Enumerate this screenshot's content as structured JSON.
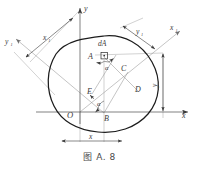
{
  "figure": {
    "caption": "图 A. 8",
    "background_color": "#ffffff",
    "curve_color": "#1c1c1c",
    "construction_color": "#8c8c8c",
    "label_color": "#3a3a3a"
  },
  "axes": {
    "y_label": "y",
    "x_label": "x",
    "x1_label": "x",
    "x1_sub": "1",
    "y1_label": "y",
    "y1_sub": "1",
    "origin_label": "O"
  },
  "dimensions": {
    "x1_label": "x",
    "x1_sub": "1",
    "y1_label": "y",
    "y1_sub": "1",
    "x_label": "x",
    "y_label": "y"
  },
  "points": {
    "A": "A",
    "B": "B",
    "C": "C",
    "D": "D",
    "E": "E",
    "element": "dA"
  },
  "angles": {
    "alpha_upper": "α",
    "alpha_lower": "α"
  }
}
